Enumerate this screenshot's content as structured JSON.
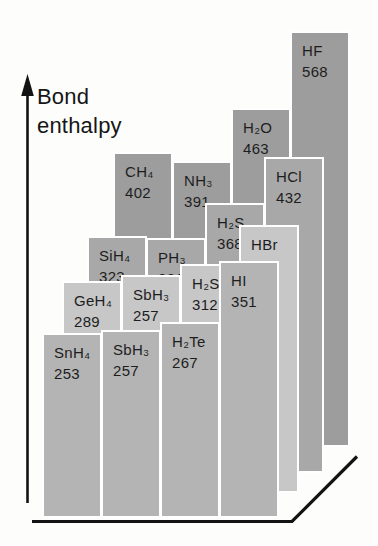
{
  "figure": {
    "kind": "textbook-3d-bar-chart",
    "background_color": "#fdfdfc"
  },
  "chart_data": {
    "type": "bar",
    "title": "Bond enthalpy",
    "axis": {
      "label": "Bond enthalpy",
      "arrow_direction": "up"
    },
    "rows": [
      {
        "row_name": "period-2-back-row",
        "color": "#9d9d9d",
        "x0": 113,
        "floor_y": 447,
        "bars": [
          {
            "formula": "CH₄",
            "value": 402
          },
          {
            "formula": "NH₃",
            "value": 391
          },
          {
            "formula": "H₂O",
            "value": 463
          },
          {
            "formula": "HF",
            "value": 568
          }
        ]
      },
      {
        "row_name": "period-3-row",
        "color": "#a8a8a8",
        "x0": 87,
        "floor_y": 473,
        "bars": [
          {
            "formula": "SiH₄",
            "value": 323
          },
          {
            "formula": "PH₃",
            "value": 321
          },
          {
            "formula": "H₂S",
            "value": 368
          },
          {
            "formula": "HCl",
            "value": 432
          }
        ]
      },
      {
        "row_name": "period-4-row",
        "color": "#c7c7c7",
        "x0": 62,
        "floor_y": 493,
        "bars": [
          {
            "formula": "GeH₄",
            "value": 289
          },
          {
            "formula": "SbH₃",
            "value": 257,
            "bar_value": 297
          },
          {
            "formula": "H₂Se",
            "value": 312
          },
          {
            "formula": "HBr",
            "value": 366
          }
        ]
      },
      {
        "row_name": "period-5-front-row",
        "color": "#b4b4b4",
        "x0": 42,
        "floor_y": 518,
        "bars": [
          {
            "formula": "SnH₄",
            "value": 253
          },
          {
            "formula": "SbH₃",
            "value": 257
          },
          {
            "formula": "H₂Te",
            "value": 267
          },
          {
            "formula": "HI",
            "value": 351
          }
        ]
      }
    ],
    "layout": {
      "bar_width": 60,
      "column_pitch": 59,
      "units_per_px": 1.365,
      "bar_border_color": "#ffffff",
      "label_text_color": "#1d1d1d"
    },
    "floor": {
      "baseline_from": [
        32,
        521
      ],
      "baseline_corner": [
        292,
        521
      ],
      "diagonal_to": [
        357,
        456
      ],
      "line_color": "#131313"
    },
    "y_axis": {
      "x": 27.5,
      "top_tip_y": 74,
      "bottom_y": 503,
      "line_color": "#131313"
    }
  }
}
